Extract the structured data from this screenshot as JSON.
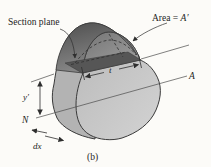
{
  "figure": {
    "type": "textbook-mechanics-diagram",
    "caption": "(b)",
    "labels": {
      "section_plane": "Section plane",
      "area_prefix": "Area = ",
      "area_var": "A′",
      "width_t": "t",
      "axis_a": "A",
      "axis_n": "N",
      "y_prime": "y′",
      "dx": "dx"
    },
    "colors": {
      "background": "#fcfbf8",
      "front_light": "#d3d3d3",
      "front_dark": "#b9b9b9",
      "band": "#b3b3b3",
      "band_top_dark": "#4e4e4e",
      "band_top_light": "#8c8c8c",
      "cap_dark": "#747474",
      "cap_light": "#a2a2a2",
      "cut_strip": "#565656",
      "outline": "#3a3a3a",
      "thin_line": "#4a4a4a"
    }
  }
}
